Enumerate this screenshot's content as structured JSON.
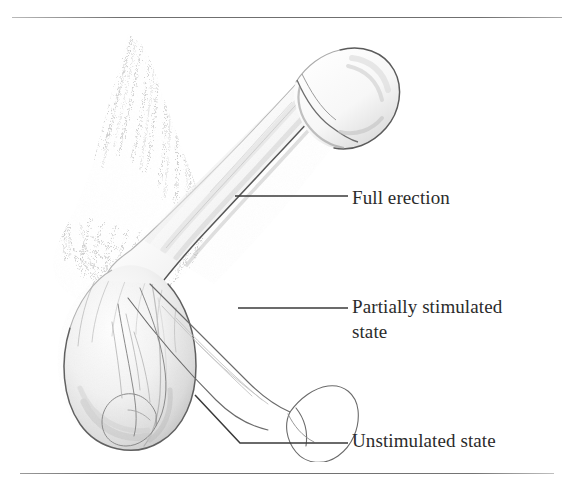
{
  "figure": {
    "style": "pen-and-ink stipple anatomical illustration",
    "background_color": "#ffffff",
    "ink_color": "#2b2b2b",
    "line_color": "#6f6f6f",
    "shade_color": "#d9d9d9"
  },
  "rules": {
    "top_label": "top-divider-rule",
    "bottom_label": "bottom-divider-rule"
  },
  "labels": [
    {
      "id": "full-erection",
      "text": "Full erection",
      "leader": "horizontal"
    },
    {
      "id": "partially-stimulated",
      "text": "Partially stimulated\nstate",
      "leader": "horizontal"
    },
    {
      "id": "unstimulated",
      "text": "Unstimulated state",
      "leader": "elbow"
    }
  ],
  "illustration": {
    "parts": [
      "erect-shaft",
      "glans",
      "coronal-ridge",
      "pubic-hair-texture",
      "scrotum",
      "partially-stimulated-outline",
      "unstimulated-outline"
    ]
  }
}
